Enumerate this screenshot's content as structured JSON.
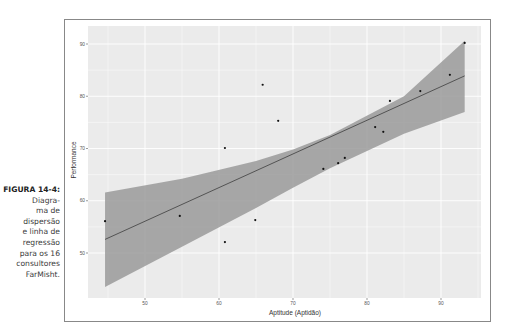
{
  "caption": {
    "label": "FIGURA 14-4:",
    "lines": [
      "Diagra-",
      "ma de",
      "dispersão",
      "e linha de",
      "regressão",
      "para os 16",
      "consultores",
      "FarMisht."
    ]
  },
  "chart_data": {
    "type": "scatter",
    "title": "",
    "xlabel": "Aptitude (Aptidão)",
    "ylabel": "Performance",
    "xlim": [
      43,
      96
    ],
    "ylim": [
      46,
      93
    ],
    "xticks": [
      50,
      60,
      70,
      80,
      90
    ],
    "yticks": [
      50,
      60,
      70,
      80,
      90
    ],
    "grid": true,
    "points": [
      {
        "x": 44.6,
        "y": 56.1
      },
      {
        "x": 54.7,
        "y": 57.1
      },
      {
        "x": 60.8,
        "y": 52.1
      },
      {
        "x": 60.8,
        "y": 70.1
      },
      {
        "x": 64.9,
        "y": 56.3
      },
      {
        "x": 65.9,
        "y": 82.2
      },
      {
        "x": 68.0,
        "y": 75.3
      },
      {
        "x": 74.1,
        "y": 66.1
      },
      {
        "x": 76.1,
        "y": 67.2
      },
      {
        "x": 77.0,
        "y": 68.2
      },
      {
        "x": 81.1,
        "y": 74.1
      },
      {
        "x": 82.2,
        "y": 73.2
      },
      {
        "x": 83.1,
        "y": 79.1
      },
      {
        "x": 87.2,
        "y": 81.0
      },
      {
        "x": 91.2,
        "y": 84.1
      },
      {
        "x": 93.2,
        "y": 90.2
      }
    ],
    "regression_line": {
      "x": [
        44.6,
        93.2
      ],
      "y": [
        52.6,
        83.9
      ]
    },
    "confidence_band": {
      "x": [
        44.6,
        55,
        65,
        70,
        75,
        85,
        93.2
      ],
      "upper": [
        61.6,
        64.2,
        67.6,
        69.8,
        72.6,
        80.0,
        90.6
      ],
      "lower": [
        43.5,
        51.2,
        58.6,
        62.5,
        66.2,
        72.8,
        77.0
      ]
    },
    "colors": {
      "panel": "#ebebeb",
      "grid": "#ffffff",
      "band": "#9a9a9a",
      "line": "#4a4a4a",
      "point": "#111111"
    }
  }
}
